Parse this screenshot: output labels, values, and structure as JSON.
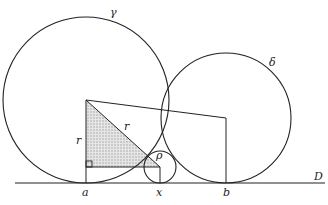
{
  "diagram": {
    "labels": {
      "gamma": "γ",
      "delta": "δ",
      "rho": "ρ",
      "r_vertical": "r",
      "r_hypotenuse": "r",
      "a": "a",
      "x": "x",
      "b": "b",
      "D": "D"
    },
    "circles": [
      {
        "name": "gamma",
        "cx": 86,
        "cy": 100,
        "r": 83
      },
      {
        "name": "delta",
        "cx": 226,
        "cy": 118,
        "r": 65
      },
      {
        "name": "rho",
        "cx": 160,
        "cy": 167,
        "r": 16
      }
    ],
    "line_D": {
      "y": 183,
      "x1": 15,
      "x2": 325
    },
    "colors": {
      "stroke": "#222222",
      "shade": "#cfcfcf"
    }
  }
}
